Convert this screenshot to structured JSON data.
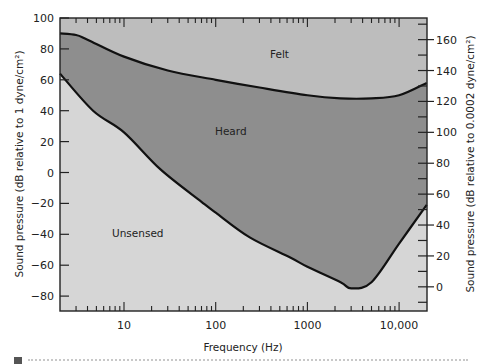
{
  "chart_data": {
    "type": "area",
    "title": "",
    "xlabel": "Frequency (Hz)",
    "ylabel": "Sound pressure (dB relative to 1 dyne/cm²)",
    "ylabel_right": "Sound pressure (dB relative to 0.0002 dyne/cm²)",
    "xscale": "log",
    "xlim": [
      2,
      20000
    ],
    "ylim": [
      -90,
      100
    ],
    "ylim_right": [
      -16,
      174
    ],
    "right_axis_offset_db": 74,
    "xticks": [
      10,
      100,
      1000,
      10000
    ],
    "xtick_labels": [
      "10",
      "100",
      "1000",
      "10,000"
    ],
    "yticks": [
      100,
      80,
      60,
      40,
      20,
      0,
      -20,
      -40,
      -60,
      -80
    ],
    "yticks_right": [
      160,
      140,
      120,
      100,
      80,
      60,
      40,
      20,
      0
    ],
    "grid": false,
    "regions": [
      {
        "name": "Felt",
        "label": "Felt",
        "color": "#bdbdbd"
      },
      {
        "name": "Heard",
        "label": "Heard",
        "color": "#8e8e8e"
      },
      {
        "name": "Unsensed",
        "label": "Unsensed",
        "color": "#d6d6d6"
      }
    ],
    "series": [
      {
        "name": "Threshold of feeling",
        "x": [
          2,
          3,
          4,
          10,
          30,
          100,
          300,
          1000,
          2300,
          5000,
          10000,
          20000
        ],
        "values": [
          90,
          89,
          86,
          75,
          66,
          60,
          55,
          50,
          48,
          48,
          50,
          58
        ]
      },
      {
        "name": "Threshold of hearing",
        "x": [
          2,
          4.6,
          10,
          25,
          70,
          100,
          235,
          650,
          1000,
          2300,
          3000,
          5000,
          10000,
          20000
        ],
        "values": [
          64,
          40,
          26,
          2,
          -19,
          -26,
          -42,
          -55,
          -61,
          -71,
          -75,
          -71,
          -46,
          -21
        ]
      }
    ]
  }
}
